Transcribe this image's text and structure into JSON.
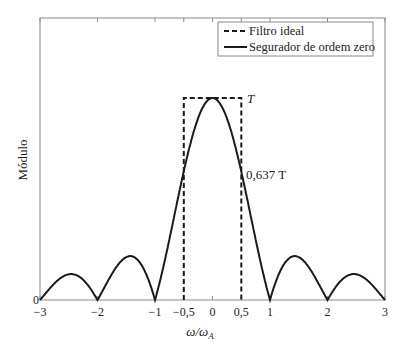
{
  "chart_data": {
    "type": "line",
    "title": "",
    "xlabel": "ω/ω_A",
    "xlabel_main": "ω/ω",
    "xlabel_sub": "A",
    "ylabel": "Módulo",
    "xlim": [
      -3,
      3
    ],
    "ylim": [
      0,
      1.1
    ],
    "grid": false,
    "legend_position": "upper right",
    "x_ticks": [
      -3,
      -2,
      -1,
      -0.5,
      0,
      0.5,
      1,
      2,
      3
    ],
    "x_tick_labels": [
      "−3",
      "−2",
      "−1",
      "−0,5",
      "0",
      "0,5",
      "1",
      "2",
      "3"
    ],
    "y_tick_labels": [
      "0"
    ],
    "series": [
      {
        "name": "Filtro ideal",
        "style": "dashed",
        "x": [
          -0.5,
          -0.5,
          0.5,
          0.5
        ],
        "y": [
          0,
          1,
          1,
          0
        ]
      },
      {
        "name": "Segurador de ordem zero",
        "style": "solid",
        "formula": "T·|sin(πω/ω_A)/(πω/ω_A)|",
        "x": [
          -3,
          -2.46,
          -2,
          -1.43,
          -1,
          -0.5,
          0,
          0.5,
          1,
          1.43,
          2,
          2.46,
          3
        ],
        "y": [
          0,
          0.13,
          0,
          0.217,
          0,
          0.637,
          1,
          0.637,
          0,
          0.217,
          0,
          0.13,
          0
        ]
      }
    ],
    "annotations": [
      {
        "text": "T",
        "x": 0.5,
        "y": 1
      },
      {
        "text": "0,637 T",
        "x": 0.5,
        "y": 0.637
      }
    ]
  },
  "legend": {
    "items": [
      {
        "label": "Filtro ideal",
        "style": "dashed"
      },
      {
        "label": "Segurador de ordem zero",
        "style": "solid"
      }
    ]
  },
  "annotations": {
    "peak": "T",
    "half": "0,637 T"
  },
  "colors": {
    "line": "#1a1a1a",
    "axis": "#8a8a8a",
    "background": "#ffffff"
  }
}
